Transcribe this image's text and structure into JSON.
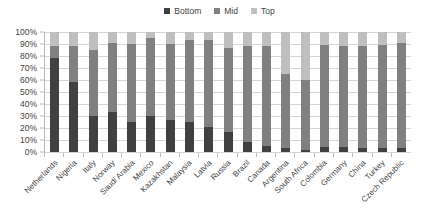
{
  "chart_data": {
    "type": "bar",
    "subtype": "stacked-bar-100-percent",
    "title": "",
    "subtitle": "",
    "xlabel": "",
    "ylabel": "",
    "ylim": [
      0,
      100
    ],
    "y_tick_labels": [
      "100%",
      "90%",
      "80%",
      "70%",
      "60%",
      "50%",
      "40%",
      "30%",
      "20%",
      "10%",
      "0%"
    ],
    "y_tick_values": [
      100,
      90,
      80,
      70,
      60,
      50,
      40,
      30,
      20,
      10,
      0
    ],
    "grid": true,
    "legend_position": "top-center",
    "categories": [
      "Netherlands",
      "Nigeria",
      "Italy",
      "Norway",
      "Saudi Arabia",
      "Mexico",
      "Kazakhstan",
      "Malaysia",
      "Latvia",
      "Russia",
      "Brazil",
      "Canada",
      "Argentina",
      "South Africa",
      "Colombia",
      "Germany",
      "China",
      "Turkey",
      "Czech Republic"
    ],
    "series": [
      {
        "name": "Bottom",
        "color": "#404040",
        "values": [
          78,
          58,
          30,
          33,
          25,
          30,
          27,
          25,
          21,
          17,
          8,
          5,
          3,
          2,
          4,
          4,
          3,
          3,
          3
        ]
      },
      {
        "name": "Mid",
        "color": "#808080",
        "values": [
          10,
          30,
          55,
          58,
          65,
          65,
          63,
          68,
          72,
          70,
          80,
          83,
          62,
          58,
          85,
          84,
          85,
          86,
          88
        ]
      },
      {
        "name": "Top",
        "color": "#bfbfbf",
        "values": [
          12,
          12,
          15,
          9,
          10,
          5,
          10,
          7,
          7,
          13,
          12,
          12,
          35,
          40,
          11,
          12,
          12,
          11,
          9
        ]
      }
    ]
  },
  "legend": {
    "items": [
      {
        "label": "Bottom",
        "color": "#404040"
      },
      {
        "label": "Mid",
        "color": "#808080"
      },
      {
        "label": "Top",
        "color": "#bfbfbf"
      }
    ]
  },
  "colors": {
    "bottom": "#404040",
    "mid": "#808080",
    "top": "#bfbfbf",
    "gridline": "#d6d6d6",
    "axis": "#b9b9b9",
    "text": "#3f3f3f",
    "background": "#ffffff"
  }
}
